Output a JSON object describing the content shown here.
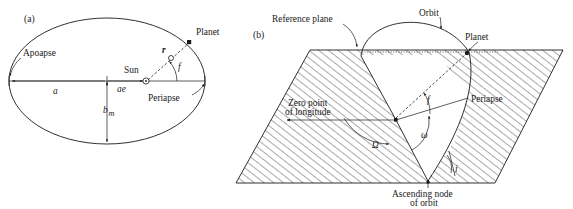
{
  "figure": {
    "background_color": "#ffffff",
    "line_color": "#1a1a1a",
    "panels": [
      {
        "id": "a",
        "panel_label": "(a)",
        "description": "Elliptical orbit of a planet about the Sun showing orbital geometry in the orbit plane",
        "labels": {
          "apoapse": "Apoapse",
          "periapse": "Periapse",
          "sun": "Sun",
          "planet": "Planet",
          "semi_major_axis": "a",
          "focal_distance": "ae",
          "semi_minor_axis": "b",
          "semi_minor_axis_subscript": "m",
          "radius_vector": "r",
          "true_anomaly": "f"
        }
      },
      {
        "id": "b",
        "panel_label": "(b)",
        "description": "Three dimensional orbit geometry relative to a reference plane showing the orbital elements",
        "labels": {
          "reference_plane": "Reference plane",
          "orbit": "Orbit",
          "planet": "Planet",
          "periapse": "Periapse",
          "zero_point_line1": "Zero point",
          "zero_point_line2": "of longitude",
          "ascending_node_line1": "Ascending node",
          "ascending_node_line2": "of orbit",
          "longitude_ascending_node": "Ω",
          "argument_of_periapse": "ω",
          "true_anomaly": "f",
          "inclination": "i"
        }
      }
    ]
  }
}
